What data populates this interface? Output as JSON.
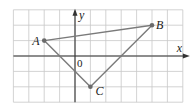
{
  "diagram": {
    "type": "coordinate-plane-triangle",
    "grid": {
      "x_min": -4,
      "x_max": 7,
      "y_min": -3,
      "y_max": 3,
      "origin_px": [
        75,
        56
      ],
      "cell_px": 15.4,
      "color": "#c8c8c8"
    },
    "axes": {
      "x_label": "x",
      "y_label": "y",
      "origin_label": "0",
      "color": "#333333"
    },
    "points": [
      {
        "name": "A",
        "x": -2,
        "y": 1
      },
      {
        "name": "B",
        "x": 5,
        "y": 2
      },
      {
        "name": "C",
        "x": 1,
        "y": -2
      }
    ],
    "segments": [
      [
        "A",
        "B"
      ],
      [
        "B",
        "C"
      ],
      [
        "C",
        "A"
      ]
    ],
    "line_color": "#7a7a7a",
    "point_color": "#6a6a6a"
  }
}
